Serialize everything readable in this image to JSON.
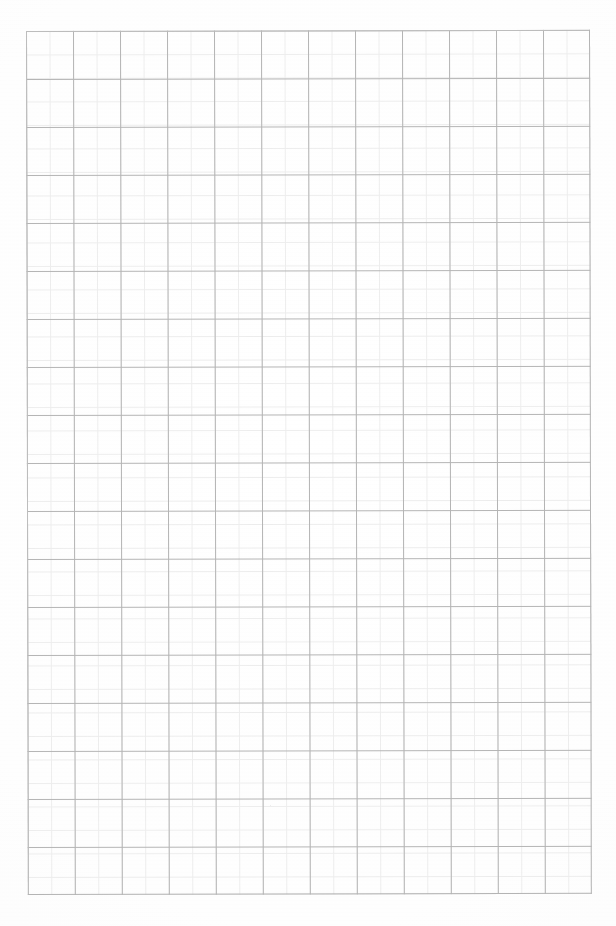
{
  "document": {
    "kind": "graph-paper-scan",
    "content_text": "",
    "page_width": 616,
    "page_height": 926,
    "background_color": "#ffffff"
  },
  "grid": {
    "offset_x": 26,
    "offset_y": 31,
    "width": 564,
    "height": 864,
    "major_columns": 12,
    "major_rows": 18,
    "major_cell_width": 47,
    "major_cell_height": 48,
    "major_line_color": "#b4b4b4",
    "minor_subdivisions": 2,
    "minor_cell_size": 23.5,
    "minor_line_color": "#ededed",
    "border_color": "#bdbdbd",
    "skew_degrees": -0.12
  },
  "paper": {
    "tint_color": "#fdfdfd",
    "vignette_color": "rgba(0,0,0,0.028)"
  }
}
